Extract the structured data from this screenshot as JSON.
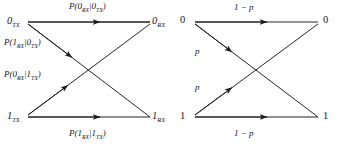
{
  "figure": {
    "type": "binary-symmetric-channel",
    "panels": [
      {
        "id": "left",
        "notation": "conditional-probability",
        "nodes": {
          "top_left": {
            "symbol": "0",
            "sub": "TX"
          },
          "top_right": {
            "symbol": "0",
            "sub": "RX"
          },
          "bottom_left": {
            "symbol": "1",
            "sub": "TX"
          },
          "bottom_right": {
            "symbol": "1",
            "sub": "RX"
          }
        },
        "edges": [
          {
            "name": "top-horizontal",
            "from": "0TX",
            "to": "0RX",
            "label_prefix": "P(0",
            "label_sub1": "RX",
            "label_mid": "|0",
            "label_sub2": "TX",
            "label_suffix": ")"
          },
          {
            "name": "upper-diagonal",
            "from": "0TX",
            "to": "1RX",
            "label_prefix": "P(1",
            "label_sub1": "RX",
            "label_mid": "|0",
            "label_sub2": "TX",
            "label_suffix": ")"
          },
          {
            "name": "lower-diagonal",
            "from": "1TX",
            "to": "0RX",
            "label_prefix": "P(0",
            "label_sub1": "RX",
            "label_mid": "|1",
            "label_sub2": "TX",
            "label_suffix": ")"
          },
          {
            "name": "bottom-horizontal",
            "from": "1TX",
            "to": "1RX",
            "label_prefix": "P(1",
            "label_sub1": "RX",
            "label_mid": "|1",
            "label_sub2": "TX",
            "label_suffix": ")"
          }
        ]
      },
      {
        "id": "right",
        "notation": "crossover-probability",
        "nodes": {
          "top_left": {
            "symbol": "0"
          },
          "top_right": {
            "symbol": "0"
          },
          "bottom_left": {
            "symbol": "1"
          },
          "bottom_right": {
            "symbol": "1"
          }
        },
        "edges": [
          {
            "name": "top-horizontal",
            "from": "0",
            "to": "0",
            "label": "1 − p"
          },
          {
            "name": "upper-diagonal",
            "from": "0",
            "to": "1",
            "label": "p"
          },
          {
            "name": "lower-diagonal",
            "from": "1",
            "to": "0",
            "label": "p"
          },
          {
            "name": "bottom-horizontal",
            "from": "1",
            "to": "1",
            "label": "1 − p"
          }
        ]
      }
    ],
    "colors": {
      "stroke": "#1a1a1f",
      "text": "#16161a",
      "background": "#ffffff"
    }
  }
}
